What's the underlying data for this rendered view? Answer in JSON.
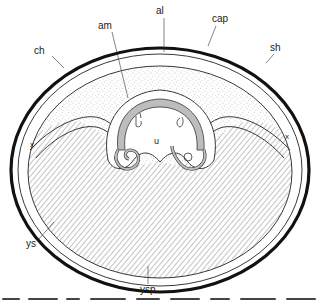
{
  "figure": {
    "labels": {
      "am": "am",
      "al": "al",
      "cap": "cap",
      "ch": "ch",
      "sh": "sh",
      "x_left": "x",
      "x_right": "x",
      "u": "u",
      "ys": "ys",
      "ysp": "ysp"
    },
    "caption_truncated": true,
    "colors": {
      "shell": "#111111",
      "line": "#222222",
      "stipple": "#9a9a9a",
      "hatch": "#8a8a8a",
      "embryo_fill": "#bdbdbd",
      "background": "#ffffff"
    }
  }
}
